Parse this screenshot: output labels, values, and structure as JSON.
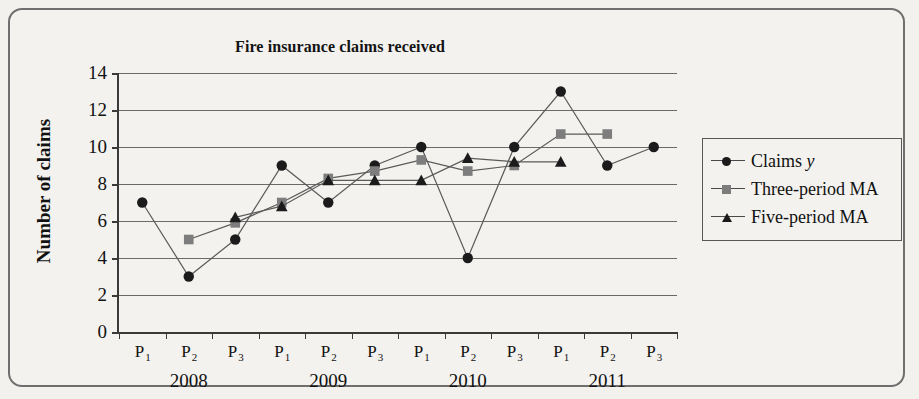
{
  "chart_data": {
    "type": "line",
    "title": "Fire insurance claims received",
    "xlabel": "",
    "ylabel": "Number of claims",
    "ylim": [
      0,
      14
    ],
    "ytick_step": 2,
    "yticks": [
      0,
      2,
      4,
      6,
      8,
      10,
      12,
      14
    ],
    "grid": true,
    "legend_position": "right",
    "categories": [
      "P1",
      "P2",
      "P3",
      "P1",
      "P2",
      "P3",
      "P1",
      "P2",
      "P3",
      "P1",
      "P2",
      "P3"
    ],
    "category_labels": [
      {
        "letter": "P",
        "sub": "1"
      },
      {
        "letter": "P",
        "sub": "2"
      },
      {
        "letter": "P",
        "sub": "3"
      },
      {
        "letter": "P",
        "sub": "1"
      },
      {
        "letter": "P",
        "sub": "2"
      },
      {
        "letter": "P",
        "sub": "3"
      },
      {
        "letter": "P",
        "sub": "1"
      },
      {
        "letter": "P",
        "sub": "2"
      },
      {
        "letter": "P",
        "sub": "3"
      },
      {
        "letter": "P",
        "sub": "1"
      },
      {
        "letter": "P",
        "sub": "2"
      },
      {
        "letter": "P",
        "sub": "3"
      }
    ],
    "group_labels": [
      {
        "label": "2008",
        "start_index": 0,
        "end_index": 2
      },
      {
        "label": "2009",
        "start_index": 3,
        "end_index": 5
      },
      {
        "label": "2010",
        "start_index": 6,
        "end_index": 8
      },
      {
        "label": "2011",
        "start_index": 9,
        "end_index": 11
      }
    ],
    "series": [
      {
        "name": "Claims y",
        "marker": "circle",
        "color": "#1b1b1b",
        "values": [
          7,
          3,
          5,
          9,
          7,
          9,
          10,
          4,
          10,
          13,
          9,
          10
        ]
      },
      {
        "name": "Three-period MA",
        "marker": "square",
        "color": "#7d7d7d",
        "values": [
          null,
          5.0,
          5.9,
          7.0,
          8.3,
          8.7,
          9.3,
          8.7,
          9.0,
          10.7,
          10.7,
          null
        ]
      },
      {
        "name": "Five-period MA",
        "marker": "triangle",
        "color": "#1b1b1b",
        "values": [
          null,
          null,
          6.2,
          6.8,
          8.2,
          8.2,
          8.2,
          9.4,
          9.2,
          9.2,
          null,
          null
        ]
      }
    ]
  },
  "legend": {
    "items": [
      {
        "label_main": "Claims ",
        "label_italic": "y",
        "marker": "circle-marker"
      },
      {
        "label_main": "Three-period MA",
        "label_italic": "",
        "marker": "square-marker"
      },
      {
        "label_main": "Five-period    MA",
        "label_italic": "",
        "marker": "triangle-marker"
      }
    ]
  }
}
